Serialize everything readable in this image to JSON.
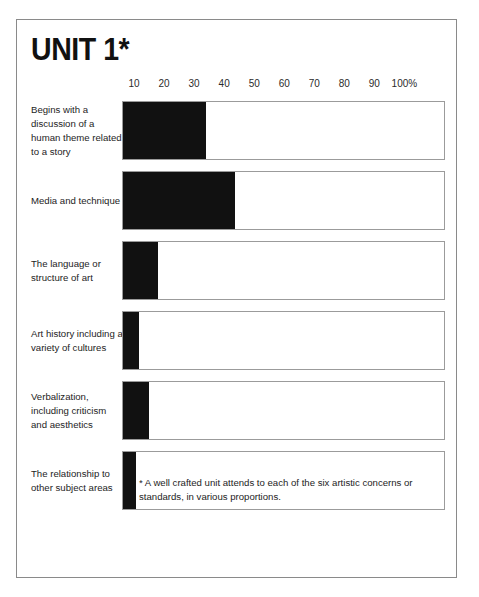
{
  "title": "UNIT 1*",
  "axis": {
    "ticks": [
      "10",
      "20",
      "30",
      "40",
      "50",
      "60",
      "70",
      "80",
      "90",
      "100%"
    ],
    "unit_suffix": "%"
  },
  "footnote": "* A well crafted unit attends to each of the six artistic concerns or standards, in various proportions.",
  "colors": {
    "bar": "#111111",
    "border": "#8a8a8a",
    "track_border": "#9b9b9b",
    "text": "#1d1d1d",
    "background": "#ffffff"
  },
  "chart_data": {
    "type": "bar",
    "orientation": "horizontal",
    "title": "UNIT 1*",
    "xlabel": "",
    "ylabel": "",
    "xlim": [
      0,
      100
    ],
    "grid": false,
    "legend": "none",
    "tick_labels": [
      "10",
      "20",
      "30",
      "40",
      "50",
      "60",
      "70",
      "80",
      "90",
      "100%"
    ],
    "categories": [
      "Begins with a discussion of a human theme related to a story",
      "Media and technique",
      "The language or structure of art",
      "Art history including a variety of cultures",
      "Verbalization, including criticism and aesthetics",
      "The relationship to other subject areas"
    ],
    "values": [
      26,
      35,
      11,
      5,
      8,
      4
    ],
    "annotations": [
      "* A well crafted unit attends to each of the six artistic concerns or standards, in various proportions."
    ]
  }
}
